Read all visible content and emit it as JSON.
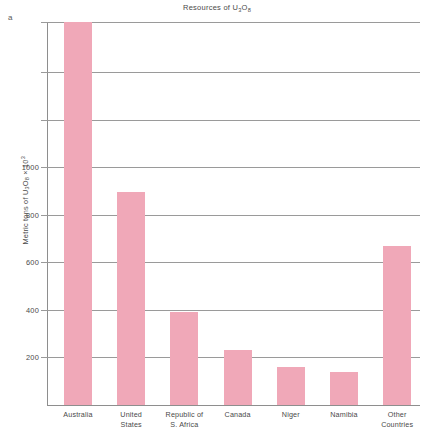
{
  "panel_label": "a",
  "chart_data": {
    "type": "bar",
    "title": "Resources of U3O8",
    "title_parts": {
      "prefix": "Resources of U",
      "sub1": "3",
      "mid": "O",
      "sub2": "8"
    },
    "ylabel": "Metric tons of U3O8 x 10^3",
    "ylabel_parts": {
      "prefix": "Metric tons of U",
      "sub1": "3",
      "mid": "O",
      "sub2": "8",
      "times": " × 10",
      "sup": "3"
    },
    "xlabel": "",
    "categories": [
      "Australia",
      "United States",
      "Republic of S. Africa",
      "Canada",
      "Niger",
      "Namibia",
      "Other Countries"
    ],
    "category_lines": [
      [
        "Australia"
      ],
      [
        "United",
        "States"
      ],
      [
        "Republic of",
        "S. Africa"
      ],
      [
        "Canada"
      ],
      [
        "Niger"
      ],
      [
        "Namibia"
      ],
      [
        "Other",
        "Countries"
      ]
    ],
    "values": [
      1610,
      895,
      390,
      230,
      160,
      140,
      670
    ],
    "ylim": [
      0,
      1610
    ],
    "yticks": [
      200,
      400,
      600,
      800,
      1000
    ],
    "ytick_labels": [
      "200",
      "400",
      "600",
      "800",
      "1000"
    ],
    "unlabeled_gridlines": [
      1200,
      1400,
      1610
    ],
    "grid": true,
    "legend": "none",
    "bar_color": "#f0a8b8",
    "axis_color": "#8e8e8e",
    "text_color": "#4a4a4a"
  }
}
